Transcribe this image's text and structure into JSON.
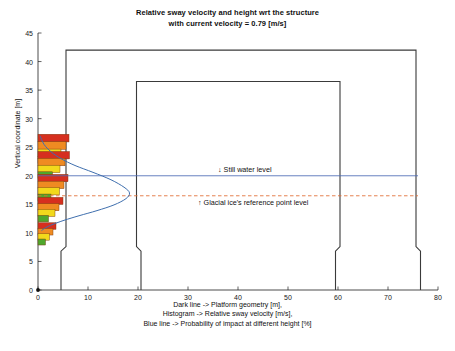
{
  "figure": {
    "title_line1": "Relative sway velocity and height wrt the structure",
    "title_line2": "with current velocity = 0.79 [m/s]",
    "ylabel": "Vertical coordinate [m]",
    "caption_line1": "Dark line -> Platform geometry [m],",
    "caption_line2": "Histogram -> Relative sway velocity [m/s],",
    "caption_line3": "Blue line -> Probability of impact at different height [%]",
    "annotation_still_water": "↓ Still water level",
    "annotation_glacial_ice": "↑ Glacial ice's reference point level"
  },
  "colors": {
    "structure_line": "#3a3a3a",
    "still_water_line": "#4d6bb5",
    "glacial_ice_line": "#e06a30",
    "probability_curve": "#3f6fae",
    "bar_red": "#d62f1f",
    "bar_orange": "#ef8b22",
    "bar_yellow": "#f2d91c",
    "bar_green": "#4fa72c",
    "axis": "#202020",
    "grid": "#ffffff"
  },
  "chart_data": {
    "type": "bar",
    "title": "Relative sway velocity and height wrt the structure with current velocity = 0.79 [m/s]",
    "xlabel": "Dark line -> Platform geometry [m], Histogram -> Relative sway velocity [m/s], Blue line -> Probability of impact at different height [%]",
    "ylabel": "Vertical coordinate [m]",
    "xlim": [
      0,
      80
    ],
    "ylim": [
      0,
      45
    ],
    "xticks": [
      0,
      10,
      20,
      30,
      40,
      50,
      60,
      70,
      80
    ],
    "yticks": [
      0,
      5,
      10,
      15,
      20,
      25,
      30,
      35,
      40,
      45
    ],
    "orientation": "horizontal",
    "grid": false,
    "legend": "none",
    "histogram_series": [
      {
        "name": "red",
        "color": "#d62f1f"
      },
      {
        "name": "orange",
        "color": "#ef8b22"
      },
      {
        "name": "yellow",
        "color": "#f2d91c"
      },
      {
        "name": "green",
        "color": "#4fa72c"
      }
    ],
    "histogram_bars": [
      {
        "y": 26.6,
        "height": 1.35,
        "value": 6.2,
        "color": "#d62f1f"
      },
      {
        "y": 25.3,
        "height": 1.35,
        "value": 5.6,
        "color": "#ef8b22"
      },
      {
        "y": 24.0,
        "height": 1.35,
        "value": 4.6,
        "color": "#f2d91c"
      },
      {
        "y": 22.8,
        "height": 1.25,
        "value": 3.1,
        "color": "#4fa72c"
      },
      {
        "y": 23.6,
        "height": 1.3,
        "value": 6.3,
        "color": "#d62f1f"
      },
      {
        "y": 22.4,
        "height": 1.3,
        "value": 5.4,
        "color": "#ef8b22"
      },
      {
        "y": 21.2,
        "height": 1.3,
        "value": 4.4,
        "color": "#f2d91c"
      },
      {
        "y": 20.1,
        "height": 1.2,
        "value": 2.9,
        "color": "#4fa72c"
      },
      {
        "y": 19.6,
        "height": 1.3,
        "value": 6.0,
        "color": "#d62f1f"
      },
      {
        "y": 18.4,
        "height": 1.3,
        "value": 5.2,
        "color": "#ef8b22"
      },
      {
        "y": 17.3,
        "height": 1.3,
        "value": 4.3,
        "color": "#f2d91c"
      },
      {
        "y": 16.2,
        "height": 1.2,
        "value": 2.6,
        "color": "#4fa72c"
      },
      {
        "y": 15.6,
        "height": 1.25,
        "value": 5.0,
        "color": "#d62f1f"
      },
      {
        "y": 14.5,
        "height": 1.25,
        "value": 4.2,
        "color": "#ef8b22"
      },
      {
        "y": 13.5,
        "height": 1.25,
        "value": 3.4,
        "color": "#f2d91c"
      },
      {
        "y": 12.5,
        "height": 1.15,
        "value": 2.1,
        "color": "#4fa72c"
      },
      {
        "y": 11.2,
        "height": 1.15,
        "value": 3.6,
        "color": "#d62f1f"
      },
      {
        "y": 10.2,
        "height": 1.15,
        "value": 3.0,
        "color": "#ef8b22"
      },
      {
        "y": 9.3,
        "height": 1.15,
        "value": 2.3,
        "color": "#f2d91c"
      },
      {
        "y": 8.4,
        "height": 1.05,
        "value": 1.5,
        "color": "#4fa72c"
      }
    ],
    "still_water_level": 20.0,
    "glacial_ice_level": 16.5,
    "annotation_line_x_extent": [
      0,
      76
    ],
    "probability_curve": {
      "description": "Probability of impact at different height [%]",
      "points": [
        [
          0.4,
          27.0
        ],
        [
          1.2,
          25.5
        ],
        [
          2.6,
          24.2
        ],
        [
          4.6,
          23.0
        ],
        [
          7.4,
          21.8
        ],
        [
          11.0,
          20.6
        ],
        [
          14.6,
          19.3
        ],
        [
          17.2,
          18.0
        ],
        [
          18.3,
          17.0
        ],
        [
          17.6,
          16.0
        ],
        [
          15.2,
          14.9
        ],
        [
          11.8,
          13.9
        ],
        [
          8.2,
          13.0
        ],
        [
          5.2,
          12.2
        ],
        [
          3.0,
          11.5
        ],
        [
          1.5,
          10.9
        ],
        [
          0.7,
          10.4
        ]
      ]
    },
    "platform_geometry": {
      "description": "Platform geometry [m]",
      "outline": [
        [
          4.6,
          0.0
        ],
        [
          4.6,
          6.8
        ],
        [
          5.6,
          7.6
        ],
        [
          5.6,
          42.0
        ],
        [
          75.6,
          42.0
        ],
        [
          75.6,
          7.6
        ],
        [
          76.5,
          6.8
        ],
        [
          76.5,
          0.0
        ]
      ],
      "inner_outline": [
        [
          20.6,
          0.0
        ],
        [
          20.6,
          6.8
        ],
        [
          19.7,
          7.6
        ],
        [
          19.7,
          36.5
        ],
        [
          60.4,
          36.5
        ],
        [
          60.4,
          7.6
        ],
        [
          59.5,
          6.8
        ],
        [
          59.5,
          0.0
        ]
      ],
      "leg_left_span": [
        4.6,
        20.6
      ],
      "leg_right_span": [
        59.5,
        76.5
      ],
      "deck_top": 42.0,
      "inner_deck_top": 36.5,
      "shoulder_height": 7.0
    }
  },
  "axes": {
    "xticks": [
      "0",
      "10",
      "20",
      "30",
      "40",
      "50",
      "60",
      "70",
      "80"
    ],
    "yticks": [
      "0",
      "5",
      "10",
      "15",
      "20",
      "25",
      "30",
      "35",
      "40",
      "45"
    ]
  }
}
